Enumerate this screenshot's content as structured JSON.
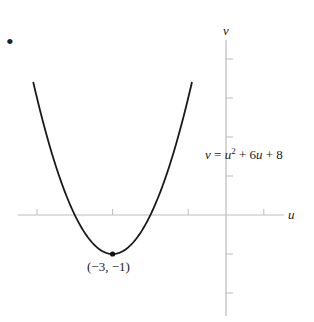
{
  "chart_data": {
    "type": "line",
    "title": "",
    "function": "v = u^2 + 6u + 8",
    "xlabel": "u",
    "ylabel": "v",
    "xlim": [
      -5.1,
      2.3
    ],
    "ylim": [
      -2.8,
      4.0
    ],
    "x_tick_step": 2,
    "y_tick_step": 1,
    "grid": false,
    "legend": null,
    "series": [
      {
        "name": "v = u^2 + 6u + 8",
        "x": [
          -5.1,
          -5,
          -4.5,
          -4,
          -3.5,
          -3,
          -2.5,
          -2,
          -1.5,
          -1,
          -0.9
        ],
        "y": [
          4.41,
          3,
          1.25,
          0,
          -0.75,
          -1,
          -0.75,
          0,
          1.25,
          3,
          4.41
        ]
      }
    ],
    "annotations": [
      {
        "text": "(−3, −1)",
        "x": -3,
        "y": -1,
        "type": "vertex-point"
      },
      {
        "text": "v = u² + 6u + 8",
        "type": "equation-label"
      }
    ]
  },
  "labels": {
    "marker": "•",
    "v_axis": "v",
    "u_axis": "u",
    "eq_v": "v",
    "eq_eq": " = ",
    "eq_u": "u",
    "eq_sup": "2",
    "eq_rest1": " + 6",
    "eq_u2": "u",
    "eq_rest2": " + 8",
    "vertex": "(−3, −1)"
  },
  "colors": {
    "curve": "#1a1a1a",
    "axis": "#b8b8b8",
    "text": "#222222"
  }
}
